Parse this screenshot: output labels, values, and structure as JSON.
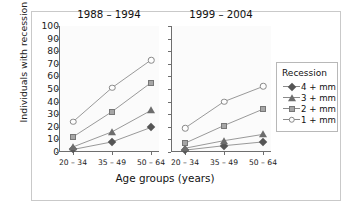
{
  "chart_data": {
    "type": "line",
    "title": "",
    "xlabel": "Age groups (years)",
    "ylabel": "Individuals with recession (%)",
    "ylim": [
      0,
      100
    ],
    "ytick_values": [
      0,
      10,
      20,
      30,
      40,
      50,
      60,
      70,
      80,
      90,
      100
    ],
    "categories": [
      "20 – 34",
      "35 – 49",
      "50 – 64"
    ],
    "grid": false,
    "legend": {
      "title": "Recession",
      "position": "right",
      "entries": [
        {
          "label": "4 + mm",
          "marker": "filled-diamond",
          "color": "#555555"
        },
        {
          "label": "3 + mm",
          "marker": "filled-triangle",
          "color": "#6d6d6d"
        },
        {
          "label": "2 + mm",
          "marker": "filled-square",
          "color": "#a6a6a6"
        },
        {
          "label": "1 + mm",
          "marker": "open-circle",
          "color": "#fdfdfd"
        }
      ]
    },
    "panels": [
      {
        "title": "1988 – 1994",
        "series": [
          {
            "name": "4 + mm",
            "marker": "filled-diamond",
            "values": [
              2,
              8,
              19.5
            ]
          },
          {
            "name": "3 + mm",
            "marker": "filled-triangle",
            "values": [
              4,
              16,
              33
            ]
          },
          {
            "name": "2 + mm",
            "marker": "filled-square",
            "values": [
              12,
              32,
              55
            ]
          },
          {
            "name": "1 + mm",
            "marker": "open-circle",
            "values": [
              24,
              51,
              73
            ]
          }
        ]
      },
      {
        "title": "1999 – 2004",
        "series": [
          {
            "name": "4 + mm",
            "marker": "filled-diamond",
            "values": [
              1.5,
              5,
              8
            ]
          },
          {
            "name": "3 + mm",
            "marker": "filled-triangle",
            "values": [
              3,
              9,
              14
            ]
          },
          {
            "name": "2 + mm",
            "marker": "filled-square",
            "values": [
              7,
              21,
              34
            ]
          },
          {
            "name": "1 + mm",
            "marker": "open-circle",
            "values": [
              19,
              40,
              52
            ]
          }
        ]
      }
    ]
  }
}
